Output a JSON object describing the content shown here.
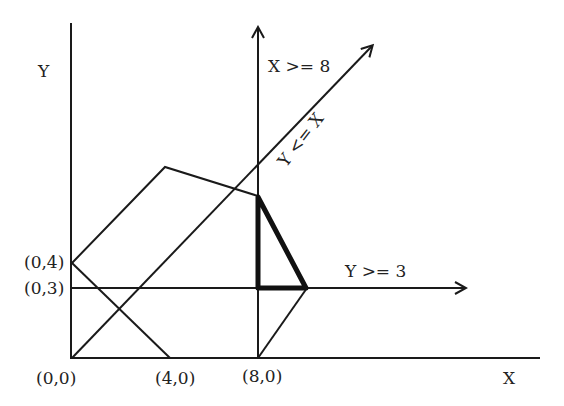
{
  "diagram": {
    "type": "linear-programming-feasible-region",
    "axes": {
      "x_label": "X",
      "y_label": "Y"
    },
    "points": {
      "origin": "(0,0)",
      "x4": "(4,0)",
      "x8": "(8,0)",
      "y4": "(0,4)",
      "y3": "(0,3)"
    },
    "constraints": {
      "x_ge_8": "X >= 8",
      "y_le_x": "Y <= X",
      "y_ge_3": "Y >= 3"
    },
    "colors": {
      "line": "#1a1a1a",
      "feasible_region_outline": "#111111",
      "background": "#ffffff"
    }
  }
}
